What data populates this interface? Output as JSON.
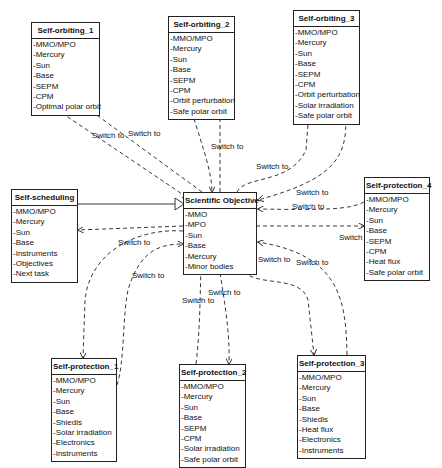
{
  "diagram": {
    "nodes": [
      {
        "id": "so1",
        "title": "Self-orbiting_1",
        "items": [
          "MMO/MPO",
          "Mercury",
          "Sun",
          "Base",
          "SEPM",
          "CPM",
          "Optimal polar orbit"
        ]
      },
      {
        "id": "so2",
        "title": "Self-orbiting_2",
        "items": [
          "MMO/MPO",
          "Mercury",
          "Sun",
          "Base",
          "SEPM",
          "CPM",
          "Orbit perturbation",
          "Safe polar orbit"
        ]
      },
      {
        "id": "so3",
        "title": "Self-orbiting_3",
        "items": [
          "MMO/MPO",
          "Mercury",
          "Sun",
          "Base",
          "SEPM",
          "CPM",
          "Orbit perturbation",
          "Solar irradiation",
          "Safe polar orbit"
        ]
      },
      {
        "id": "ss",
        "title": "Self-scheduling",
        "items": [
          "MMO/MPO",
          "Mercury",
          "Sun",
          "Base",
          "Instruments",
          "Objectives",
          "Next task"
        ]
      },
      {
        "id": "sci",
        "title": "Scientific Objective",
        "items": [
          "MMO",
          "MPO",
          "Sun",
          "Base",
          "Mercury",
          "Minor bodies"
        ]
      },
      {
        "id": "sp4",
        "title": "Self-protection_4",
        "items": [
          "MMO/MPO",
          "Mercury",
          "Sun",
          "Base",
          "SEPM",
          "CPM",
          "Heat flux",
          "Safe polar orbit"
        ]
      },
      {
        "id": "sp1",
        "title": "Self-protection_1",
        "items": [
          "MMO/MPO",
          "Mercury",
          "Sun",
          "Base",
          "Shiedls",
          "Solar irradiation",
          "Electronics",
          "Instruments"
        ]
      },
      {
        "id": "sp2",
        "title": "Self-protection_2",
        "items": [
          "MMO/MPO",
          "Mercury",
          "Sun",
          "Base",
          "SEPM",
          "CPM",
          "Solar irradiation",
          "Safe polar orbit"
        ]
      },
      {
        "id": "sp3",
        "title": "Self-protection_3",
        "items": [
          "MMO/MPO",
          "Mercury",
          "Sun",
          "Base",
          "Shiedls",
          "Heat flux",
          "Electronics",
          "Instruments"
        ]
      }
    ],
    "edge_label": "Switch to",
    "labels": [
      "Switch to",
      "Switch to",
      "Switch to",
      "Switch to",
      "Switch to",
      "Switch to",
      "Switch to",
      "Switch to",
      "Switch to",
      "Switch to",
      "Switch to",
      "Switch to",
      "Switch to",
      "Switch to"
    ],
    "edges": [
      {
        "from": "Self-orbiting_1",
        "to": "Scientific Objective",
        "label": "Switch to",
        "style": "dashed"
      },
      {
        "from": "Scientific Objective",
        "to": "Self-orbiting_1",
        "label": "Switch to",
        "style": "dashed"
      },
      {
        "from": "Self-orbiting_2",
        "to": "Scientific Objective",
        "label": "",
        "style": "dashed"
      },
      {
        "from": "Scientific Objective",
        "to": "Self-orbiting_2",
        "label": "Switch to",
        "style": "dashed"
      },
      {
        "from": "Self-orbiting_3",
        "to": "Scientific Objective",
        "label": "Switch to",
        "style": "dashed"
      },
      {
        "from": "Scientific Objective",
        "to": "Self-orbiting_3",
        "label": "Switch to",
        "style": "dashed"
      },
      {
        "from": "Self-scheduling",
        "to": "Scientific Objective",
        "label": "",
        "style": "generalization"
      },
      {
        "from": "Scientific Objective",
        "to": "Self-scheduling",
        "label": "Switch to",
        "style": "dashed"
      },
      {
        "from": "Self-protection_4",
        "to": "Scientific Objective",
        "label": "Switch to",
        "style": "dashed"
      },
      {
        "from": "Scientific Objective",
        "to": "Self-protection_4",
        "label": "Switch to",
        "style": "dashed"
      },
      {
        "from": "Scientific Objective",
        "to": "Self-protection_1",
        "label": "Switch to",
        "style": "dashed"
      },
      {
        "from": "Self-protection_1",
        "to": "Scientific Objective",
        "label": "Switch to",
        "style": "dashed"
      },
      {
        "from": "Scientific Objective",
        "to": "Self-protection_2",
        "label": "Switch to",
        "style": "dashed"
      },
      {
        "from": "Self-protection_2",
        "to": "Scientific Objective",
        "label": "Switch to",
        "style": "dashed"
      },
      {
        "from": "Scientific Objective",
        "to": "Self-protection_3",
        "label": "Switch to",
        "style": "dashed"
      },
      {
        "from": "Self-protection_3",
        "to": "Scientific Objective",
        "label": "Switch to",
        "style": "dashed"
      }
    ]
  }
}
